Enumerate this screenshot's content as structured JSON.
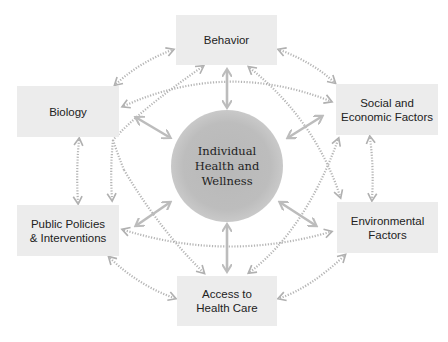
{
  "diagram": {
    "center": {
      "lines": [
        "Individual",
        "Health and",
        "Wellness"
      ]
    },
    "nodes": [
      {
        "id": "behavior",
        "lines": [
          "Behavior"
        ]
      },
      {
        "id": "biology",
        "lines": [
          "Biology"
        ]
      },
      {
        "id": "social",
        "lines": [
          "Social and",
          "Economic Factors"
        ]
      },
      {
        "id": "policies",
        "lines": [
          "Public Policies",
          "& Interventions"
        ]
      },
      {
        "id": "environmental",
        "lines": [
          "Environmental",
          "Factors"
        ]
      },
      {
        "id": "access",
        "lines": [
          "Access to",
          "Health Care"
        ]
      }
    ],
    "colors": {
      "box_fill": "#ececec",
      "hub_fill": "#bdbdbd",
      "solid_arrow": "#bcbcbc",
      "dotted_arrow": "#b5b5b5",
      "text": "#222222"
    }
  }
}
